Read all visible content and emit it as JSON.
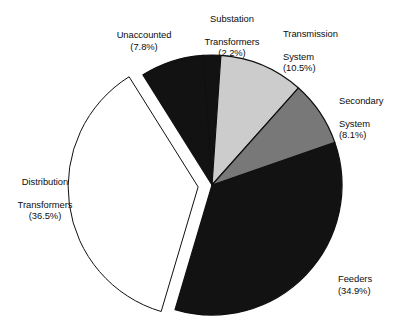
{
  "chart_data": {
    "type": "pie",
    "title": "",
    "subtitle": "",
    "xlabel": "",
    "ylabel": "",
    "legend_position": "none",
    "grid": false,
    "labels_show_percent": true,
    "units": "percent",
    "total": 100.0,
    "categories": [
      "Substation Transformers",
      "Transmission System",
      "Secondary System",
      "Feeders",
      "Distribution Transformers",
      "Unaccounted"
    ],
    "values": [
      2.2,
      10.5,
      8.1,
      34.9,
      36.5,
      7.8
    ],
    "slices": [
      {
        "name": "substation-transformers",
        "label": "Substation\nTransformers",
        "label_line1": "Substation",
        "label_line2": "Transformers",
        "percent_text": "(2.2%)",
        "value": 2.2,
        "color": "#121212",
        "fill_kind": "black",
        "exploded": false,
        "start_angle_deg": 0.0,
        "end_angle_deg": 7.92
      },
      {
        "name": "transmission-system",
        "label": "Transmission\nSystem",
        "label_line1": "Transmission",
        "label_line2": "System",
        "percent_text": "(10.5%)",
        "value": 10.5,
        "color": "#cccccc",
        "fill_kind": "light-grey",
        "exploded": false,
        "start_angle_deg": 7.92,
        "end_angle_deg": 45.72
      },
      {
        "name": "secondary-system",
        "label": "Secondary\nSystem",
        "label_line1": "Secondary",
        "label_line2": "System",
        "percent_text": "(8.1%)",
        "value": 8.1,
        "color": "#787878",
        "fill_kind": "medium-grey",
        "exploded": false,
        "start_angle_deg": 45.72,
        "end_angle_deg": 74.88
      },
      {
        "name": "feeders",
        "label": "Feeders",
        "label_line1": "Feeders",
        "label_line2": "",
        "percent_text": "(34.9%)",
        "value": 34.9,
        "color": "#121212",
        "fill_kind": "black",
        "exploded": false,
        "start_angle_deg": 74.88,
        "end_angle_deg": 200.52
      },
      {
        "name": "distribution-transformers",
        "label": "Distribution\nTransformers",
        "label_line1": "Distribution",
        "label_line2": "Transformers",
        "percent_text": "(36.5%)",
        "value": 36.5,
        "color": "#ffffff",
        "fill_kind": "white-outlined",
        "exploded": true,
        "start_angle_deg": 200.52,
        "end_angle_deg": 331.92
      },
      {
        "name": "unaccounted",
        "label": "Unaccounted",
        "label_line1": "Unaccounted",
        "label_line2": "",
        "percent_text": "(7.8%)",
        "value": 7.8,
        "color": "#121212",
        "fill_kind": "black",
        "exploded": false,
        "start_angle_deg": 331.92,
        "end_angle_deg": 360.0
      }
    ],
    "colors": {
      "black": "#121212",
      "light_grey": "#cccccc",
      "medium_grey": "#787878",
      "white": "#ffffff",
      "outline": "#101010",
      "background": "#ffffff",
      "text": "#0d0d0d"
    },
    "geometry": {
      "center_x": 212,
      "center_y": 185,
      "radius": 130,
      "explode_offset": 14,
      "rotation_deg": -4
    }
  }
}
